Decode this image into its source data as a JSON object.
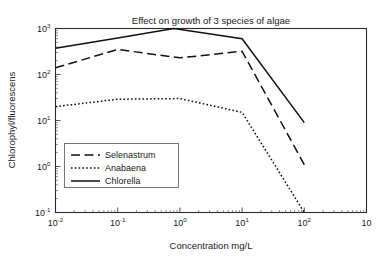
{
  "chart_data": {
    "type": "line",
    "title": "Effect on growth of 3 species of algae",
    "xlabel": "Concentration mg/L",
    "ylabel": "Chlorophyl/fluorescens",
    "xscale": "log",
    "yscale": "log",
    "xlim": [
      0.01,
      1000
    ],
    "ylim": [
      0.1,
      1000
    ],
    "grid": false,
    "legend_position": "lower-left-inside",
    "xticklabels": [
      "10-2",
      "10-1",
      "100",
      "101",
      "102",
      "10"
    ],
    "xtickvalues": [
      0.01,
      0.1,
      1,
      10,
      100,
      1000
    ],
    "yticklabels": [
      "103",
      "102",
      "101",
      "100",
      "10-1"
    ],
    "ytickvalues": [
      1000,
      100,
      10,
      1,
      0.1
    ],
    "series": [
      {
        "name": "Selenastrum",
        "style": "dashed",
        "x": [
          0.01,
          0.1,
          1,
          10,
          100
        ],
        "values": [
          140,
          350,
          230,
          320,
          1.1
        ]
      },
      {
        "name": "Anabaena",
        "style": "dotted",
        "x": [
          0.01,
          0.1,
          1,
          10,
          100
        ],
        "values": [
          20,
          29,
          30,
          15,
          0.1
        ]
      },
      {
        "name": "Chlorella",
        "style": "solid",
        "x": [
          0.01,
          0.1,
          0.8,
          10,
          100
        ],
        "values": [
          370,
          620,
          1000,
          600,
          9
        ]
      }
    ]
  },
  "axis_ticks": {
    "x_sup": [
      "-2",
      "-1",
      "0",
      "1",
      "2",
      ""
    ],
    "x_base": [
      "10",
      "10",
      "10",
      "10",
      "10",
      "10"
    ],
    "y_sup": [
      "3",
      "2",
      "1",
      "0",
      "-1"
    ],
    "y_base": [
      "10",
      "10",
      "10",
      "10",
      "10"
    ]
  },
  "legend": {
    "entries": [
      {
        "label": "Selenastrum",
        "style": "dashed"
      },
      {
        "label": "Anabaena",
        "style": "dotted"
      },
      {
        "label": "Chlorella",
        "style": "solid"
      }
    ]
  },
  "colors": {
    "line": "#111111",
    "frame": "#2b2b2b",
    "text": "#1a1a1a",
    "background": "#ffffff"
  }
}
